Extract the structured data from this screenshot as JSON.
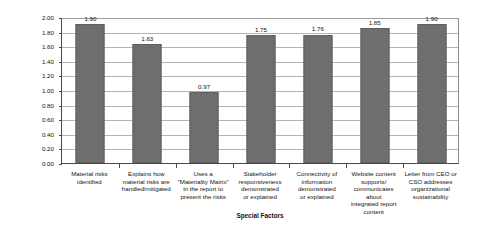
{
  "chart_data": {
    "type": "bar",
    "title": "",
    "xlabel": "Special Factors",
    "ylabel": "Average Score Range:  0–3.0",
    "ylim": [
      0,
      2.0
    ],
    "ytick_interval": 0.2,
    "ytick_labels": [
      "0.00",
      "0.20",
      "0.40",
      "0.60",
      "0.80",
      "1.00",
      "1.20",
      "1.40",
      "1.60",
      "1.80",
      "2.00"
    ],
    "grid": true,
    "legend": "none",
    "bar_color": "#6e6e6e",
    "categories": [
      "Material risks identified",
      "Explains how material risks are handled/mitigated",
      "Uses a \"Materiality Matrix\" in the report to present the risks",
      "Stakeholder responsiveness demonstrated or explained",
      "Connectivity of information demonstrated or explained",
      "Website content supports/ communicates about integrated report content",
      "Letter from CEO or CSO addresses organizational sustainability"
    ],
    "category_lines": [
      [
        "Material risks",
        "identified"
      ],
      [
        "Explains how",
        "material risks are",
        "handled/mitigated"
      ],
      [
        "Uses a",
        "\"Materiality Matrix\"",
        "in the report to",
        "present the risks"
      ],
      [
        "Stakeholder",
        "responsiveness",
        "demonstrated",
        "or explained"
      ],
      [
        "Connectivity of",
        "information",
        "demonstrated",
        "or explained"
      ],
      [
        "Website content",
        "supports/",
        "communicates about",
        "integrated report",
        "content"
      ],
      [
        "Letter from CEO or",
        "CSO addresses",
        "organizational",
        "sustainability"
      ]
    ],
    "values": [
      1.9,
      1.63,
      0.97,
      1.75,
      1.76,
      1.85,
      1.9
    ],
    "value_labels": [
      "1.90",
      "1.63",
      "0.97",
      "1.75",
      "1.76",
      "1.85",
      "1.90"
    ]
  }
}
